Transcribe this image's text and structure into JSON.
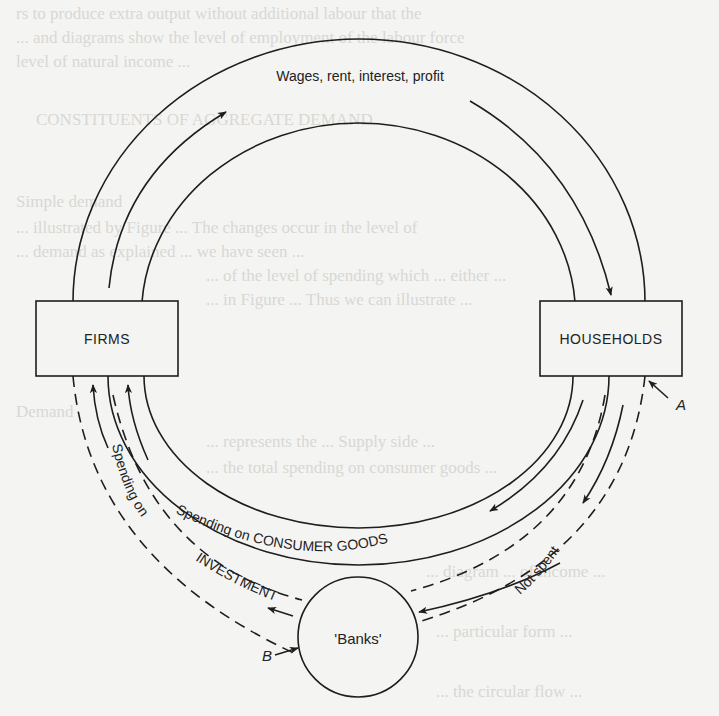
{
  "diagram": {
    "type": "circular-flow-of-income",
    "nodes": {
      "firms": {
        "label": "FIRMS"
      },
      "households": {
        "label": "HOUSEHOLDS"
      },
      "banks": {
        "label": "'Banks'"
      }
    },
    "flows": {
      "factor_payments": {
        "label": "Wages, rent, interest, profit",
        "from": "FIRMS",
        "to": "HOUSEHOLDS"
      },
      "consumer_spending": {
        "label": "Spending on CONSUMER GOODS",
        "from": "HOUSEHOLDS",
        "to": "FIRMS"
      },
      "investment": {
        "label_prefix": "Spending on",
        "label_main": "INVESTMENT",
        "from": "'Banks'",
        "to": "FIRMS"
      },
      "savings": {
        "label": "Not spent",
        "from": "HOUSEHOLDS",
        "to": "'Banks'"
      }
    },
    "markers": {
      "a": {
        "label": "A"
      },
      "b": {
        "label": "B"
      }
    }
  },
  "background_bleed": {
    "lines": [
      "rs to produce extra output without additional labour that the",
      "... and diagrams show the level of employment of the labour force",
      "level of natural income ...",
      "",
      "CONSTITUENTS OF AGGREGATE DEMAND",
      "",
      "Simple demand",
      "... illustrated by Figure ... The changes occur in the level of",
      "... demand as explained ... we have seen ...",
      "... of the level of spending which ... either ...",
      "... in Figure ... Thus we can illustrate ...",
      "",
      "",
      "Demand",
      "... represents the ... Supply side ...",
      "... the total spending on consumer goods ...",
      "... Some ... part of",
      "... firms on the ... ",
      "... the ... circular flow ...",
      "... diagram ... of income ...",
      "... particular form ...",
      "... wages and earnings ...",
      "... the circular flow ..."
    ]
  }
}
